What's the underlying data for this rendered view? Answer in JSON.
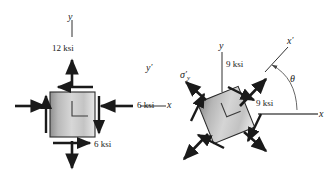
{
  "figure": {
    "background": "#ffffff",
    "ink": "#1a1a1a"
  },
  "left_element": {
    "name": "original-stress-element",
    "axes": {
      "y_label": "y",
      "x_label": "x"
    },
    "stresses": [
      {
        "id": "sigma-y",
        "value": "12 ksi",
        "direction": "up",
        "position": "top"
      },
      {
        "id": "sigma-x",
        "value": "6 ksi",
        "direction": "left",
        "position": "right"
      },
      {
        "id": "tau-xy",
        "value": "6 ksi",
        "direction": "right",
        "position": "bottom"
      }
    ],
    "labels": {
      "top_value": "12 ksi",
      "right_value": "6 ksi",
      "bottom_value": "6 ksi"
    }
  },
  "right_element": {
    "name": "rotated-stress-element",
    "axes": {
      "y_label": "y",
      "x_label": "x",
      "x_prime_label": "x",
      "x_prime_mark": "′",
      "y_prime_label": "y",
      "y_prime_mark": "′",
      "theta_label": "θ"
    },
    "stresses": [
      {
        "id": "sigma-y-prime",
        "symbol": "σ",
        "prime": "′",
        "subscript": "y"
      },
      {
        "id": "sigma-normal-upper",
        "value": "9 ksi"
      },
      {
        "id": "sigma-normal-lower",
        "value": "9 ksi"
      }
    ],
    "labels": {
      "upper_value": "9 ksi",
      "lower_value": "9 ksi",
      "sigma_symbol": "σ",
      "sigma_prime": "′",
      "sigma_subscript": "y",
      "theta": "θ"
    }
  }
}
